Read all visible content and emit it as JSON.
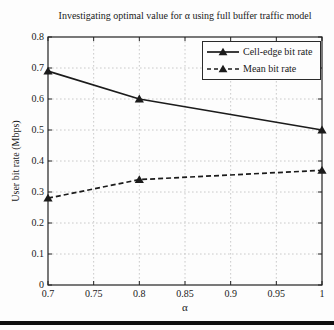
{
  "colors": {
    "text": "#1a1a1a",
    "axis": "#222222",
    "grid": "#c4c4c4",
    "background": "#fdfdfd",
    "rule": "#0f0f0f",
    "series_line": "#1b1b1b"
  },
  "chart_data": {
    "type": "line",
    "title": "Investigating optimal value for α using full buffer traffic model",
    "xlabel": "α",
    "ylabel": "User bit rate (Mbps)",
    "xlim": [
      0.7,
      1
    ],
    "ylim": [
      0,
      0.8
    ],
    "x_ticks": [
      0.7,
      0.75,
      0.8,
      0.85,
      0.9,
      0.95,
      1
    ],
    "x_tick_labels": [
      "0.7",
      "0.75",
      "0.8",
      "0.85",
      "0.9",
      "0.95",
      "1"
    ],
    "y_ticks": [
      0,
      0.1,
      0.2,
      0.3,
      0.4,
      0.5,
      0.6,
      0.7,
      0.8
    ],
    "y_tick_labels": [
      "0",
      "0.1",
      "0.2",
      "0.3",
      "0.4",
      "0.5",
      "0.6",
      "0.7",
      "0.8"
    ],
    "grid": true,
    "legend_position": "top-right",
    "series": [
      {
        "name": "Cell-edge bit rate",
        "line_style": "solid",
        "marker": "filled-triangle-up",
        "color": "#1b1b1b",
        "x": [
          0.7,
          0.8,
          1
        ],
        "y": [
          0.69,
          0.6,
          0.5
        ]
      },
      {
        "name": "Mean bit rate",
        "line_style": "dashed",
        "marker": "filled-triangle-up",
        "color": "#1b1b1b",
        "x": [
          0.7,
          0.8,
          1
        ],
        "y": [
          0.28,
          0.34,
          0.37
        ]
      }
    ]
  }
}
